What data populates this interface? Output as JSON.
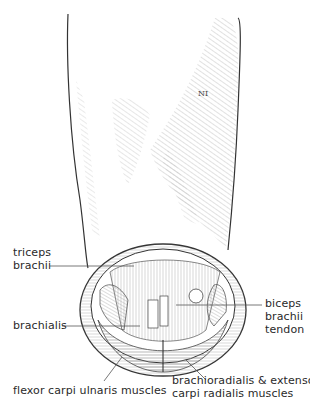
{
  "figure": {
    "line_color": "#3a3a3a",
    "hatch_color": "#8a8a8a",
    "background": "#ffffff"
  },
  "labels": {
    "triceps": {
      "line1": "triceps",
      "line2": "brachii"
    },
    "brachialis": {
      "line1": "brachialis"
    },
    "biceps": {
      "line1": "biceps",
      "line2": "brachii",
      "line3": "tendon"
    },
    "flexor": {
      "line1": "flexor carpi ulnaris muscles"
    },
    "brachioradialis": {
      "line1": "brachioradialis & extensor",
      "line2": "carpi radialis muscles"
    }
  }
}
